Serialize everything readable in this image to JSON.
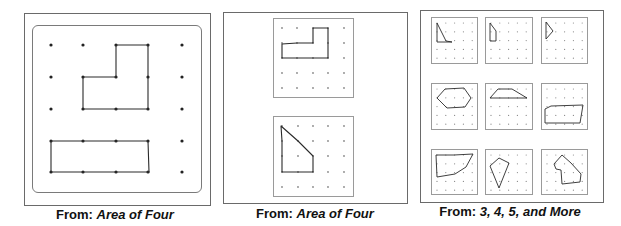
{
  "panels": [
    {
      "id": "panel-1",
      "caption": {
        "prefix": "From:",
        "source": "Area of Four"
      },
      "box": {
        "x": 24,
        "y": 13,
        "w": 187,
        "h": 193
      },
      "inner": {
        "x": 32,
        "y": 25,
        "w": 170,
        "h": 168
      },
      "grids": [
        {
          "dots_x": [
            51,
            83,
            116,
            148,
            182
          ],
          "dots_y": [
            45,
            77,
            109,
            141,
            172
          ],
          "dot_r": 1.6,
          "shapes": [
            {
              "name": "l-shape",
              "points": [
                [
                  116,
                  45
                ],
                [
                  148,
                  45
                ],
                [
                  148,
                  77
                ],
                [
                  148,
                  109
                ],
                [
                  116,
                  109
                ],
                [
                  83,
                  109
                ],
                [
                  83,
                  77
                ],
                [
                  116,
                  77
                ]
              ]
            },
            {
              "name": "rectangle",
              "points": [
                [
                  51,
                  141
                ],
                [
                  83,
                  141
                ],
                [
                  116,
                  141
                ],
                [
                  148,
                  141
                ],
                [
                  149,
                  172
                ],
                [
                  116,
                  172
                ],
                [
                  83,
                  172
                ],
                [
                  51,
                  172
                ]
              ]
            }
          ]
        }
      ]
    },
    {
      "id": "panel-2",
      "caption": {
        "prefix": "From:",
        "source": "Area of Four"
      },
      "box": {
        "x": 223,
        "y": 12,
        "w": 185,
        "h": 192
      },
      "grids": [
        {
          "frame": {
            "x": 273,
            "y": 18,
            "w": 81,
            "h": 80
          },
          "dots_x": [
            282,
            297,
            313,
            328,
            344
          ],
          "dots_y": [
            28,
            43,
            58,
            73,
            88
          ],
          "dot_r": 0.9,
          "shapes": [
            {
              "name": "l-shape",
              "points": [
                [
                  313,
                  28
                ],
                [
                  328,
                  28
                ],
                [
                  328,
                  43
                ],
                [
                  328,
                  58
                ],
                [
                  313,
                  58
                ],
                [
                  297,
                  58
                ],
                [
                  282,
                  58
                ],
                [
                  282,
                  44
                ],
                [
                  297,
                  43
                ],
                [
                  313,
                  43
                ]
              ]
            }
          ]
        },
        {
          "frame": {
            "x": 273,
            "y": 116,
            "w": 81,
            "h": 81
          },
          "dots_x": [
            282,
            298,
            313,
            328,
            344
          ],
          "dots_y": [
            126,
            141,
            156,
            172,
            187
          ],
          "dot_r": 0.9,
          "shapes": [
            {
              "name": "trapezoid",
              "points": [
                [
                  281,
                  126
                ],
                [
                  298,
                  141
                ],
                [
                  313,
                  156
                ],
                [
                  313,
                  172
                ],
                [
                  298,
                  172
                ],
                [
                  282,
                  172
                ],
                [
                  282,
                  156
                ],
                [
                  282,
                  141
                ]
              ]
            }
          ]
        }
      ]
    },
    {
      "id": "panel-3",
      "caption": {
        "prefix": "From:",
        "source": "3, 4, 5, and More"
      },
      "box": {
        "x": 420,
        "y": 10,
        "w": 184,
        "h": 193
      },
      "grids": [
        {
          "frame": {
            "x": 431,
            "y": 17,
            "w": 47,
            "h": 47
          },
          "shapes": [
            {
              "name": "triangle",
              "points": [
                [
                  437,
                  23
                ],
                [
                  446,
                  41
                ],
                [
                  452,
                  42
                ],
                [
                  437,
                  42
                ]
              ]
            }
          ]
        },
        {
          "frame": {
            "x": 485,
            "y": 17,
            "w": 48,
            "h": 47
          },
          "shapes": [
            {
              "name": "quadrilateral",
              "points": [
                [
                  490,
                  23
                ],
                [
                  496,
                  31
                ],
                [
                  496,
                  41
                ],
                [
                  490,
                  41
                ]
              ]
            }
          ]
        },
        {
          "frame": {
            "x": 541,
            "y": 17,
            "w": 47,
            "h": 47
          },
          "shapes": [
            {
              "name": "triangle",
              "points": [
                [
                  546,
                  22
                ],
                [
                  553,
                  31
                ],
                [
                  546,
                  39
                ]
              ]
            }
          ]
        },
        {
          "frame": {
            "x": 431,
            "y": 83,
            "w": 47,
            "h": 47
          },
          "shapes": [
            {
              "name": "hexagon",
              "points": [
                [
                  437,
                  98
                ],
                [
                  445,
                  89
                ],
                [
                  464,
                  88
                ],
                [
                  471,
                  98
                ],
                [
                  465,
                  107
                ],
                [
                  447,
                  108
                ]
              ]
            }
          ]
        },
        {
          "frame": {
            "x": 485,
            "y": 83,
            "w": 48,
            "h": 47
          },
          "shapes": [
            {
              "name": "trapezoid",
              "points": [
                [
                  490,
                  98
                ],
                [
                  498,
                  89
                ],
                [
                  512,
                  89
                ],
                [
                  527,
                  98
                ]
              ]
            }
          ]
        },
        {
          "frame": {
            "x": 541,
            "y": 83,
            "w": 47,
            "h": 47
          },
          "shapes": [
            {
              "name": "pentagon",
              "points": [
                [
                  545,
                  115
                ],
                [
                  545,
                  109
                ],
                [
                  551,
                  106
                ],
                [
                  583,
                  105
                ],
                [
                  580,
                  123
                ],
                [
                  545,
                  123
                ]
              ]
            }
          ]
        },
        {
          "frame": {
            "x": 431,
            "y": 149,
            "w": 47,
            "h": 46
          },
          "shapes": [
            {
              "name": "curved-quadrilateral",
              "points": [
                [
                  436,
                  155
                ],
                [
                  454,
                  155
                ],
                [
                  473,
                  154
                ],
                [
                  466,
                  167
                ],
                [
                  455,
                  174
                ],
                [
                  437,
                  177
                ]
              ]
            }
          ]
        },
        {
          "frame": {
            "x": 485,
            "y": 149,
            "w": 48,
            "h": 46
          },
          "shapes": [
            {
              "name": "kite",
              "points": [
                [
                  499,
                  158
                ],
                [
                  509,
                  163
                ],
                [
                  499,
                  188
                ],
                [
                  490,
                  166
                ]
              ]
            }
          ]
        },
        {
          "frame": {
            "x": 541,
            "y": 149,
            "w": 47,
            "h": 46
          },
          "shapes": [
            {
              "name": "complex-polygon",
              "points": [
                [
                  554,
                  164
                ],
                [
                  562,
                  155
                ],
                [
                  571,
                  163
                ],
                [
                  581,
                  174
                ],
                [
                  580,
                  182
                ],
                [
                  562,
                  184
                ],
                [
                  561,
                  170
                ],
                [
                  556,
                  169
                ]
              ]
            }
          ]
        }
      ],
      "grid_dots": {
        "cols": 5,
        "rows": 5,
        "offset": 6,
        "step": 8.8,
        "dot_r": 0.6
      }
    }
  ],
  "captions_pos": [
    {
      "x": 115,
      "y": 207
    },
    {
      "x": 315,
      "y": 206
    },
    {
      "x": 510,
      "y": 204
    }
  ],
  "colors": {
    "line": "#2a2a2a",
    "dot": "#222222",
    "faint_dot": "#888888"
  }
}
